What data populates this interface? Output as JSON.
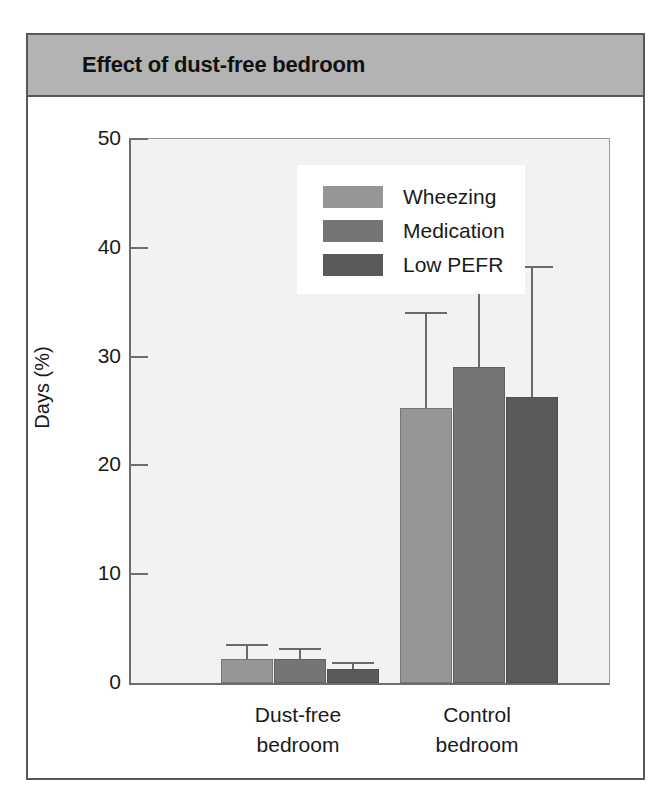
{
  "figure": {
    "title": "Effect of dust-free bedroom"
  },
  "chart_data": {
    "type": "bar",
    "title": "Effect of dust-free bedroom",
    "xlabel": "",
    "ylabel": "Days (%)",
    "ylim": [
      0,
      50
    ],
    "yticks": [
      0,
      10,
      20,
      30,
      40,
      50
    ],
    "grid": false,
    "legend_position": "upper-left-inside",
    "categories": [
      "Dust-free bedroom",
      "Control bedroom"
    ],
    "category_labels": [
      [
        "Dust-free",
        "bedroom"
      ],
      [
        "Control",
        "bedroom"
      ]
    ],
    "series": [
      {
        "name": "Wheezing",
        "color": "#969696",
        "values": [
          2.2,
          25.3
        ],
        "error_upper": [
          3.6,
          34.1
        ]
      },
      {
        "name": "Medication",
        "color": "#757577",
        "values": [
          2.2,
          29.0
        ],
        "error_upper": [
          3.2,
          41.4
        ]
      },
      {
        "name": "Low PEFR",
        "color": "#5a5a5c",
        "values": [
          1.3,
          26.3
        ],
        "error_upper": [
          1.9,
          38.3
        ]
      }
    ]
  },
  "colors": {
    "title_band": "#b3b3b3",
    "frame": "#58585a",
    "plot_background": "#f2f2f0",
    "axis": "#6e6e70",
    "error_bar": "#6a6a6c"
  }
}
